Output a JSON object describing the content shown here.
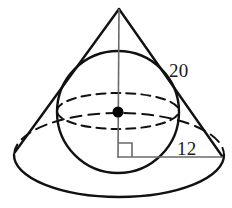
{
  "figure": {
    "stroke_color": "#111111",
    "background_color": "#ffffff",
    "dot_color": "#000000",
    "thin_line_color": "#555555"
  },
  "labels": {
    "slant_height": "20",
    "base_radius": "12"
  },
  "geometry": {
    "cone": {
      "apex": {
        "x": 119,
        "y": 8
      },
      "base_center": {
        "x": 119,
        "y": 155
      },
      "base_rx": 105,
      "base_ry": 42,
      "left_base_point": {
        "x": 15,
        "y": 152
      },
      "right_base_point": {
        "x": 222,
        "y": 156
      }
    },
    "sphere": {
      "center": {
        "x": 118,
        "y": 112
      },
      "radius": 61,
      "equator_rx": 61,
      "equator_ry": 18
    },
    "axis": {
      "from": {
        "x": 119,
        "y": 9
      },
      "to": {
        "x": 118,
        "y": 158
      }
    },
    "radius_segment": {
      "from": {
        "x": 118,
        "y": 157
      },
      "to": {
        "x": 222,
        "y": 157
      }
    },
    "right_angle_mark": {
      "corner": {
        "x": 118,
        "y": 157
      },
      "size": 14
    },
    "center_dot": {
      "x": 118,
      "y": 112,
      "r": 5
    }
  }
}
